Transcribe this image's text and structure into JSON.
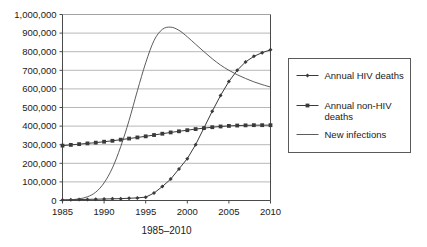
{
  "chart_data": {
    "type": "line",
    "title": "",
    "xlabel": "1985–2010",
    "ylabel": "",
    "xlim": [
      1985,
      2010
    ],
    "ylim": [
      0,
      1000000
    ],
    "grid": true,
    "legend_position": "right",
    "x": [
      1985,
      1986,
      1987,
      1988,
      1989,
      1990,
      1991,
      1992,
      1993,
      1994,
      1995,
      1996,
      1997,
      1998,
      1999,
      2000,
      2001,
      2002,
      2003,
      2004,
      2005,
      2006,
      2007,
      2008,
      2009,
      2010
    ],
    "xtick_labels": [
      "1985",
      "1990",
      "1995",
      "2000",
      "2005",
      "2010"
    ],
    "xticks": [
      1985,
      1990,
      1995,
      2000,
      2005,
      2010
    ],
    "ytick_labels": [
      "0",
      "100,000",
      "200,000",
      "300,000",
      "400,000",
      "500,000",
      "600,000",
      "700,000",
      "800,000",
      "900,000",
      "1,000,000"
    ],
    "yticks": [
      0,
      100000,
      200000,
      300000,
      400000,
      500000,
      600000,
      700000,
      800000,
      900000,
      1000000
    ],
    "series": [
      {
        "name": "Annual HIV deaths",
        "marker": "diamond",
        "color": "#3a3a3a",
        "values": [
          3000,
          4000,
          5000,
          6000,
          7000,
          8000,
          9000,
          10000,
          12000,
          14000,
          18000,
          40000,
          75000,
          115000,
          170000,
          225000,
          300000,
          390000,
          480000,
          565000,
          640000,
          700000,
          745000,
          775000,
          795000,
          810000
        ]
      },
      {
        "name": "Annual non-HIV deaths",
        "marker": "square",
        "color": "#3a3a3a",
        "values": [
          295000,
          299000,
          303000,
          307000,
          311000,
          316000,
          321000,
          327000,
          333000,
          339000,
          345000,
          352000,
          359000,
          366000,
          372000,
          378000,
          384000,
          389000,
          394000,
          398000,
          401000,
          403000,
          404000,
          405000,
          405000,
          405000
        ]
      },
      {
        "name": "New infections",
        "marker": "none",
        "color": "#4a4a4a",
        "values": [
          2000,
          4000,
          9000,
          20000,
          45000,
          95000,
          175000,
          290000,
          430000,
          590000,
          740000,
          860000,
          920000,
          932000,
          915000,
          880000,
          840000,
          800000,
          762000,
          728000,
          700000,
          676000,
          656000,
          638000,
          623000,
          610000
        ]
      }
    ]
  },
  "legend": {
    "items": [
      {
        "label_line1": "Annual HIV deaths",
        "label_line2": ""
      },
      {
        "label_line1": "Annual non-HIV",
        "label_line2": "deaths"
      },
      {
        "label_line1": "New infections",
        "label_line2": ""
      }
    ]
  }
}
